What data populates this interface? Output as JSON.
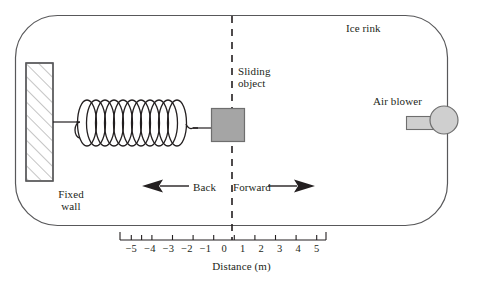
{
  "figure": {
    "labels": {
      "ice_rink": "Ice rink",
      "sliding_object_line1": "Sliding",
      "sliding_object_line2": "object",
      "air_blower": "Air blower",
      "fixed_wall_line1": "Fixed",
      "fixed_wall_line2": "wall",
      "back": "Back",
      "forward": "Forward",
      "axis_title": "Distance (m)"
    },
    "axis": {
      "title": "Distance (m)",
      "unit": "m",
      "tick_labels": [
        "−5",
        "−4",
        "−3",
        "−2",
        "−1",
        "0",
        "1",
        "2",
        "3",
        "4",
        "5"
      ],
      "tick_values": [
        -5,
        -4,
        -3,
        -2,
        -1,
        0,
        1,
        2,
        3,
        4,
        5
      ],
      "origin_value": 0,
      "range": [
        -5,
        5
      ]
    },
    "directions": {
      "left_arrow": "arrow-left",
      "right_arrow": "arrow-right",
      "left_label": "Back",
      "right_label": "Forward"
    },
    "colors": {
      "outline": "#58585a",
      "ink": "#231f20",
      "object_fill": "#a5a5a5",
      "object_stroke": "#6e6e6e",
      "blower_fill": "#cfcfcf",
      "blower_stroke": "#6e6e6e",
      "wall_fill": "#ffffff",
      "wall_stroke": "#58585a",
      "hatch": "#8a8a8a",
      "background": "#ffffff"
    },
    "elements": {
      "rink": "rounded-rectangle-boundary",
      "wall": "hatched-fixed-wall",
      "spring": "coil-spring",
      "object": "gray-square-block",
      "blower": "circle-with-nozzle",
      "centerline": "vertical-dashed-line"
    },
    "spring": {
      "coils": 11
    }
  }
}
